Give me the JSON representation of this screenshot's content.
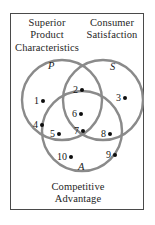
{
  "diagram": {
    "type": "venn-3-set",
    "frame": {
      "border_color": "#4a4a4a"
    },
    "circle_stroke_color": "#8a8a8a",
    "dot_color": "#0d0d0d",
    "captions": {
      "top_left": {
        "lines": [
          "Superior",
          "Product",
          "Characteristics"
        ]
      },
      "top_right": {
        "lines": [
          "Consumer",
          "Satisfaction"
        ]
      },
      "bottom": {
        "lines": [
          "Competitive",
          "Advantage"
        ]
      }
    },
    "sets": [
      {
        "id": "P",
        "label": "P",
        "caption": "Superior Product Characteristics",
        "cx": 52,
        "cy": 87,
        "r": 40
      },
      {
        "id": "S",
        "label": "S",
        "caption": "Consumer Satisfaction",
        "cx": 93,
        "cy": 87,
        "r": 40
      },
      {
        "id": "A",
        "label": "A",
        "caption": "Competitive Advantage",
        "cx": 72,
        "cy": 118,
        "r": 40
      }
    ],
    "points": [
      {
        "label": "1",
        "region": "P only",
        "x": 24,
        "y": 83
      },
      {
        "label": "2",
        "region": "P and S",
        "x": 63,
        "y": 72
      },
      {
        "label": "3",
        "region": "S only",
        "x": 106,
        "y": 80
      },
      {
        "label": "4",
        "region": "P only",
        "x": 23,
        "y": 107
      },
      {
        "label": "5",
        "region": "P and A",
        "x": 40,
        "y": 116
      },
      {
        "label": "6",
        "region": "P and S",
        "x": 62,
        "y": 96
      },
      {
        "label": "7",
        "region": "P, S and A",
        "x": 64,
        "y": 113
      },
      {
        "label": "8",
        "region": "S and A",
        "x": 91,
        "y": 116
      },
      {
        "label": "9",
        "region": "A only",
        "x": 96,
        "y": 137
      },
      {
        "label": "10",
        "region": "A only",
        "x": 47,
        "y": 139
      }
    ]
  }
}
